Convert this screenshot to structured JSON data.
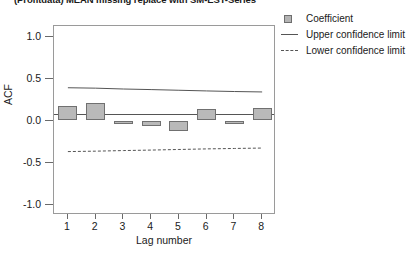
{
  "title": "(Profitdata) MEAN missing replace with SM-EST-Series",
  "legend": {
    "items": [
      {
        "label": "Coefficient",
        "key": "swatch-square",
        "color": "#b4b4b4"
      },
      {
        "label": "Upper confidence limit",
        "key": "solid-line",
        "color": "#555555"
      },
      {
        "label": "Lower confidence limit",
        "key": "dashed-line",
        "color": "#555555"
      }
    ]
  },
  "axes": {
    "ylabel": "ACF",
    "xlabel": "Lag number",
    "yticks": [
      "1.0",
      "0.5",
      "0.0",
      "-0.5",
      "-1.0"
    ],
    "ytick_values": [
      1.0,
      0.5,
      0.0,
      -0.5,
      -1.0
    ],
    "xticks": [
      "1",
      "2",
      "3",
      "4",
      "5",
      "6",
      "7",
      "8"
    ]
  },
  "chart_data": {
    "type": "bar",
    "title": "(Profitdata) MEAN missing replace with SM-EST-Series",
    "xlabel": "Lag number",
    "ylabel": "ACF",
    "ylim": [
      -1.125,
      1.125
    ],
    "xlim": [
      0.5,
      8.5
    ],
    "grid": false,
    "legend_position": "top-right-outside",
    "categories": [
      "1",
      "2",
      "3",
      "4",
      "5",
      "6",
      "7",
      "8"
    ],
    "series": [
      {
        "name": "Coefficient",
        "type": "bar",
        "color": "#b9b9b9",
        "values": [
          0.17,
          0.21,
          -0.02,
          -0.06,
          -0.12,
          0.14,
          -0.02,
          0.15
        ]
      },
      {
        "name": "Upper confidence limit",
        "type": "line",
        "style": "solid",
        "color": "#555555",
        "values": [
          0.39,
          0.385,
          0.375,
          0.368,
          0.36,
          0.352,
          0.345,
          0.34
        ]
      },
      {
        "name": "Lower confidence limit",
        "type": "line",
        "style": "dashed",
        "color": "#555555",
        "values": [
          -0.37,
          -0.365,
          -0.358,
          -0.352,
          -0.345,
          -0.338,
          -0.333,
          -0.328
        ]
      }
    ]
  }
}
